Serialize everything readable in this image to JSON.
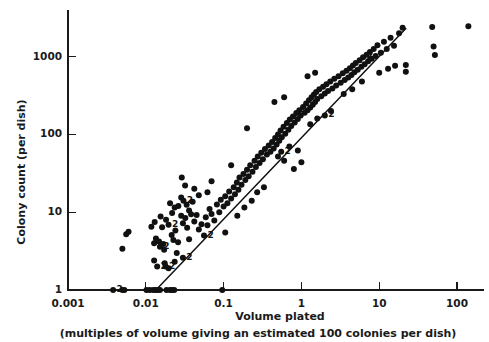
{
  "chart_data": {
    "type": "scatter",
    "title": "",
    "xlabel": "Volume plated",
    "xsublabel": "(multiples of volume giving an estimated 100 colonies per dish)",
    "ylabel": "Colony count (per dish)",
    "xscale": "log",
    "yscale": "log",
    "xlim": [
      0.001,
      200
    ],
    "ylim": [
      0.9,
      3000
    ],
    "grid": false,
    "legend": null,
    "xticks": [
      0.001,
      0.01,
      0.1,
      1,
      10,
      100
    ],
    "xtick_labels": [
      "0.001",
      "0.01",
      "0.1",
      "1",
      "10",
      "100"
    ],
    "yticks": [
      1,
      10,
      100,
      1000
    ],
    "ytick_labels": [
      "1",
      "10",
      "100",
      "1000"
    ],
    "fit_line": {
      "description": "reference line of slope 1 through 100 colonies at volume 1",
      "x_start": 0.0135,
      "y_start": 1.0,
      "x_end": 22.0,
      "y_end": 2300.0
    },
    "point_marker": "filled-circle",
    "point_radius_px": 3.0,
    "multiplicity_annotation": "2",
    "points": [
      {
        "x": 0.0038,
        "y": 1,
        "n": 2
      },
      {
        "x": 0.005,
        "y": 1,
        "n": 1
      },
      {
        "x": 0.0053,
        "y": 1,
        "n": 1
      },
      {
        "x": 0.0102,
        "y": 1,
        "n": 1
      },
      {
        "x": 0.0112,
        "y": 1,
        "n": 1
      },
      {
        "x": 0.0124,
        "y": 1,
        "n": 1
      },
      {
        "x": 0.0133,
        "y": 1,
        "n": 1
      },
      {
        "x": 0.0142,
        "y": 1,
        "n": 1
      },
      {
        "x": 0.0152,
        "y": 1,
        "n": 1
      },
      {
        "x": 0.0185,
        "y": 1,
        "n": 1
      },
      {
        "x": 0.0205,
        "y": 1,
        "n": 1
      },
      {
        "x": 0.0218,
        "y": 1,
        "n": 1
      },
      {
        "x": 0.0232,
        "y": 1,
        "n": 1
      },
      {
        "x": 0.096,
        "y": 1,
        "n": 1
      },
      {
        "x": 0.005,
        "y": 3.4,
        "n": 1
      },
      {
        "x": 0.0056,
        "y": 5.2,
        "n": 1
      },
      {
        "x": 0.006,
        "y": 5.6,
        "n": 1
      },
      {
        "x": 0.0128,
        "y": 2.4,
        "n": 1
      },
      {
        "x": 0.014,
        "y": 2.0,
        "n": 2
      },
      {
        "x": 0.0175,
        "y": 2.2,
        "n": 1
      },
      {
        "x": 0.018,
        "y": 2.0,
        "n": 2
      },
      {
        "x": 0.0196,
        "y": 1.9,
        "n": 1
      },
      {
        "x": 0.0235,
        "y": 2.3,
        "n": 1
      },
      {
        "x": 0.0128,
        "y": 4.0,
        "n": 1
      },
      {
        "x": 0.0135,
        "y": 4.6,
        "n": 1
      },
      {
        "x": 0.0148,
        "y": 4.2,
        "n": 1
      },
      {
        "x": 0.0152,
        "y": 3.6,
        "n": 2
      },
      {
        "x": 0.0168,
        "y": 3.9,
        "n": 1
      },
      {
        "x": 0.0172,
        "y": 3.3,
        "n": 1
      },
      {
        "x": 0.0118,
        "y": 6.5,
        "n": 1
      },
      {
        "x": 0.013,
        "y": 7.5,
        "n": 1
      },
      {
        "x": 0.0155,
        "y": 8.8,
        "n": 1
      },
      {
        "x": 0.0162,
        "y": 6.4,
        "n": 1
      },
      {
        "x": 0.0182,
        "y": 8.0,
        "n": 1
      },
      {
        "x": 0.0196,
        "y": 6.9,
        "n": 2
      },
      {
        "x": 0.0215,
        "y": 5.1,
        "n": 1
      },
      {
        "x": 0.0226,
        "y": 4.4,
        "n": 1
      },
      {
        "x": 0.024,
        "y": 5.8,
        "n": 1
      },
      {
        "x": 0.026,
        "y": 4.1,
        "n": 1
      },
      {
        "x": 0.0205,
        "y": 13.0,
        "n": 1
      },
      {
        "x": 0.0218,
        "y": 9.8,
        "n": 1
      },
      {
        "x": 0.0235,
        "y": 11.5,
        "n": 1
      },
      {
        "x": 0.0262,
        "y": 12.0,
        "n": 1
      },
      {
        "x": 0.0285,
        "y": 9.0,
        "n": 1
      },
      {
        "x": 0.03,
        "y": 7.2,
        "n": 1
      },
      {
        "x": 0.0322,
        "y": 8.4,
        "n": 1
      },
      {
        "x": 0.034,
        "y": 6.3,
        "n": 1
      },
      {
        "x": 0.0285,
        "y": 15.5,
        "n": 1
      },
      {
        "x": 0.0305,
        "y": 14.0,
        "n": 2
      },
      {
        "x": 0.0335,
        "y": 12.5,
        "n": 1
      },
      {
        "x": 0.036,
        "y": 10.5,
        "n": 1
      },
      {
        "x": 0.0382,
        "y": 9.4,
        "n": 1
      },
      {
        "x": 0.04,
        "y": 13.6,
        "n": 1
      },
      {
        "x": 0.042,
        "y": 7.6,
        "n": 1
      },
      {
        "x": 0.045,
        "y": 9.2,
        "n": 1
      },
      {
        "x": 0.048,
        "y": 6.0,
        "n": 1
      },
      {
        "x": 0.052,
        "y": 7.0,
        "n": 1
      },
      {
        "x": 0.056,
        "y": 5.0,
        "n": 2
      },
      {
        "x": 0.059,
        "y": 8.6,
        "n": 1
      },
      {
        "x": 0.062,
        "y": 6.8,
        "n": 1
      },
      {
        "x": 0.066,
        "y": 11.0,
        "n": 1
      },
      {
        "x": 0.07,
        "y": 9.5,
        "n": 1
      },
      {
        "x": 0.076,
        "y": 7.8,
        "n": 1
      },
      {
        "x": 0.082,
        "y": 12.6,
        "n": 1
      },
      {
        "x": 0.088,
        "y": 10.0,
        "n": 1
      },
      {
        "x": 0.092,
        "y": 14.5,
        "n": 1
      },
      {
        "x": 0.1,
        "y": 11.8,
        "n": 1
      },
      {
        "x": 0.105,
        "y": 16.0,
        "n": 1
      },
      {
        "x": 0.112,
        "y": 13.0,
        "n": 1
      },
      {
        "x": 0.118,
        "y": 18.5,
        "n": 1
      },
      {
        "x": 0.125,
        "y": 15.0,
        "n": 1
      },
      {
        "x": 0.135,
        "y": 21.0,
        "n": 1
      },
      {
        "x": 0.14,
        "y": 17.0,
        "n": 1
      },
      {
        "x": 0.148,
        "y": 24.0,
        "n": 1
      },
      {
        "x": 0.155,
        "y": 19.5,
        "n": 1
      },
      {
        "x": 0.16,
        "y": 28.0,
        "n": 1
      },
      {
        "x": 0.17,
        "y": 22.5,
        "n": 1
      },
      {
        "x": 0.18,
        "y": 31.0,
        "n": 1
      },
      {
        "x": 0.19,
        "y": 26.0,
        "n": 1
      },
      {
        "x": 0.2,
        "y": 35.0,
        "n": 1
      },
      {
        "x": 0.21,
        "y": 29.0,
        "n": 1
      },
      {
        "x": 0.22,
        "y": 40.0,
        "n": 1
      },
      {
        "x": 0.235,
        "y": 33.0,
        "n": 1
      },
      {
        "x": 0.25,
        "y": 46.0,
        "n": 1
      },
      {
        "x": 0.26,
        "y": 38.0,
        "n": 1
      },
      {
        "x": 0.275,
        "y": 52.0,
        "n": 1
      },
      {
        "x": 0.29,
        "y": 43.0,
        "n": 1
      },
      {
        "x": 0.305,
        "y": 58.0,
        "n": 1
      },
      {
        "x": 0.32,
        "y": 48.0,
        "n": 1
      },
      {
        "x": 0.34,
        "y": 65.0,
        "n": 1
      },
      {
        "x": 0.36,
        "y": 55.0,
        "n": 1
      },
      {
        "x": 0.125,
        "y": 40.0,
        "n": 1
      },
      {
        "x": 0.15,
        "y": 9.0,
        "n": 1
      },
      {
        "x": 0.185,
        "y": 11.5,
        "n": 1
      },
      {
        "x": 0.23,
        "y": 14.0,
        "n": 1
      },
      {
        "x": 0.2,
        "y": 120.0,
        "n": 1
      },
      {
        "x": 0.38,
        "y": 72.0,
        "n": 1
      },
      {
        "x": 0.4,
        "y": 60.0,
        "n": 1
      },
      {
        "x": 0.42,
        "y": 80.0,
        "n": 1
      },
      {
        "x": 0.44,
        "y": 66.0,
        "n": 1
      },
      {
        "x": 0.46,
        "y": 90.0,
        "n": 1
      },
      {
        "x": 0.48,
        "y": 74.0,
        "n": 1
      },
      {
        "x": 0.5,
        "y": 100.0,
        "n": 1
      },
      {
        "x": 0.52,
        "y": 83.0,
        "n": 1
      },
      {
        "x": 0.54,
        "y": 112.0,
        "n": 1
      },
      {
        "x": 0.56,
        "y": 92.0,
        "n": 1
      },
      {
        "x": 0.59,
        "y": 125.0,
        "n": 1
      },
      {
        "x": 0.62,
        "y": 102.0,
        "n": 1
      },
      {
        "x": 0.65,
        "y": 140.0,
        "n": 1
      },
      {
        "x": 0.68,
        "y": 115.0,
        "n": 1
      },
      {
        "x": 0.71,
        "y": 155.0,
        "n": 1
      },
      {
        "x": 0.74,
        "y": 128.0,
        "n": 1
      },
      {
        "x": 0.78,
        "y": 170.0,
        "n": 1
      },
      {
        "x": 0.82,
        "y": 142.0,
        "n": 1
      },
      {
        "x": 0.86,
        "y": 188.0,
        "n": 1
      },
      {
        "x": 0.9,
        "y": 158.0,
        "n": 1
      },
      {
        "x": 0.94,
        "y": 205.0,
        "n": 1
      },
      {
        "x": 0.98,
        "y": 175.0,
        "n": 1
      },
      {
        "x": 0.5,
        "y": 52.0,
        "n": 1
      },
      {
        "x": 0.55,
        "y": 60.0,
        "n": 2
      },
      {
        "x": 0.6,
        "y": 46.0,
        "n": 1
      },
      {
        "x": 0.7,
        "y": 70.0,
        "n": 1
      },
      {
        "x": 0.45,
        "y": 260.0,
        "n": 1
      },
      {
        "x": 0.6,
        "y": 300.0,
        "n": 1
      },
      {
        "x": 0.9,
        "y": 62.0,
        "n": 1
      },
      {
        "x": 1.05,
        "y": 225.0,
        "n": 1
      },
      {
        "x": 1.1,
        "y": 190.0,
        "n": 1
      },
      {
        "x": 1.15,
        "y": 250.0,
        "n": 1
      },
      {
        "x": 1.2,
        "y": 205.0,
        "n": 1
      },
      {
        "x": 1.25,
        "y": 275.0,
        "n": 1
      },
      {
        "x": 1.3,
        "y": 222.0,
        "n": 1
      },
      {
        "x": 1.35,
        "y": 300.0,
        "n": 1
      },
      {
        "x": 1.4,
        "y": 240.0,
        "n": 1
      },
      {
        "x": 1.45,
        "y": 325.0,
        "n": 1
      },
      {
        "x": 1.5,
        "y": 260.0,
        "n": 1
      },
      {
        "x": 1.55,
        "y": 350.0,
        "n": 1
      },
      {
        "x": 1.6,
        "y": 285.0,
        "n": 1
      },
      {
        "x": 1.7,
        "y": 380.0,
        "n": 1
      },
      {
        "x": 1.8,
        "y": 310.0,
        "n": 1
      },
      {
        "x": 1.9,
        "y": 410.0,
        "n": 1
      },
      {
        "x": 2.0,
        "y": 335.0,
        "n": 1
      },
      {
        "x": 2.1,
        "y": 440.0,
        "n": 1
      },
      {
        "x": 2.2,
        "y": 360.0,
        "n": 1
      },
      {
        "x": 2.35,
        "y": 480.0,
        "n": 1
      },
      {
        "x": 2.5,
        "y": 390.0,
        "n": 1
      },
      {
        "x": 2.65,
        "y": 520.0,
        "n": 1
      },
      {
        "x": 2.8,
        "y": 425.0,
        "n": 1
      },
      {
        "x": 1.3,
        "y": 135.0,
        "n": 1
      },
      {
        "x": 1.6,
        "y": 160.0,
        "n": 1
      },
      {
        "x": 2.0,
        "y": 175.0,
        "n": 2
      },
      {
        "x": 2.4,
        "y": 200.0,
        "n": 1
      },
      {
        "x": 1.2,
        "y": 560.0,
        "n": 1
      },
      {
        "x": 1.5,
        "y": 620.0,
        "n": 1
      },
      {
        "x": 3.0,
        "y": 560.0,
        "n": 1
      },
      {
        "x": 3.2,
        "y": 460.0,
        "n": 1
      },
      {
        "x": 3.4,
        "y": 610.0,
        "n": 1
      },
      {
        "x": 3.6,
        "y": 500.0,
        "n": 1
      },
      {
        "x": 3.8,
        "y": 660.0,
        "n": 1
      },
      {
        "x": 4.0,
        "y": 540.0,
        "n": 1
      },
      {
        "x": 4.2,
        "y": 710.0,
        "n": 1
      },
      {
        "x": 4.4,
        "y": 580.0,
        "n": 1
      },
      {
        "x": 4.6,
        "y": 770.0,
        "n": 1
      },
      {
        "x": 4.8,
        "y": 630.0,
        "n": 1
      },
      {
        "x": 5.0,
        "y": 830.0,
        "n": 1
      },
      {
        "x": 5.3,
        "y": 680.0,
        "n": 1
      },
      {
        "x": 5.6,
        "y": 900.0,
        "n": 1
      },
      {
        "x": 5.9,
        "y": 740.0,
        "n": 1
      },
      {
        "x": 6.2,
        "y": 980.0,
        "n": 2
      },
      {
        "x": 6.5,
        "y": 800.0,
        "n": 1
      },
      {
        "x": 6.9,
        "y": 1060.0,
        "n": 1
      },
      {
        "x": 7.2,
        "y": 870.0,
        "n": 1
      },
      {
        "x": 7.6,
        "y": 1150.0,
        "n": 1
      },
      {
        "x": 8.0,
        "y": 940.0,
        "n": 1
      },
      {
        "x": 3.5,
        "y": 330.0,
        "n": 1
      },
      {
        "x": 4.5,
        "y": 380.0,
        "n": 1
      },
      {
        "x": 6.0,
        "y": 480.0,
        "n": 1
      },
      {
        "x": 8.5,
        "y": 1250.0,
        "n": 1
      },
      {
        "x": 9.0,
        "y": 1020.0,
        "n": 1
      },
      {
        "x": 9.5,
        "y": 1400.0,
        "n": 1
      },
      {
        "x": 10.5,
        "y": 1120.0,
        "n": 1
      },
      {
        "x": 11.5,
        "y": 1550.0,
        "n": 1
      },
      {
        "x": 12.5,
        "y": 1250.0,
        "n": 1
      },
      {
        "x": 14.0,
        "y": 1750.0,
        "n": 1
      },
      {
        "x": 15.5,
        "y": 1380.0,
        "n": 1
      },
      {
        "x": 18.0,
        "y": 2000.0,
        "n": 1
      },
      {
        "x": 20.0,
        "y": 2350.0,
        "n": 1
      },
      {
        "x": 10.0,
        "y": 620.0,
        "n": 1
      },
      {
        "x": 13.0,
        "y": 700.0,
        "n": 1
      },
      {
        "x": 16.0,
        "y": 760.0,
        "n": 1
      },
      {
        "x": 22.0,
        "y": 780.0,
        "n": 1
      },
      {
        "x": 22.0,
        "y": 640.0,
        "n": 1
      },
      {
        "x": 48.0,
        "y": 2400.0,
        "n": 1
      },
      {
        "x": 50.0,
        "y": 1350.0,
        "n": 1
      },
      {
        "x": 52.0,
        "y": 1050.0,
        "n": 1
      },
      {
        "x": 140.0,
        "y": 2450.0,
        "n": 1
      },
      {
        "x": 0.029,
        "y": 28.0,
        "n": 1
      },
      {
        "x": 0.032,
        "y": 22.0,
        "n": 1
      },
      {
        "x": 0.062,
        "y": 18.0,
        "n": 1
      },
      {
        "x": 0.07,
        "y": 25.0,
        "n": 1
      },
      {
        "x": 0.048,
        "y": 16.5,
        "n": 1
      },
      {
        "x": 0.042,
        "y": 20.0,
        "n": 1
      },
      {
        "x": 0.105,
        "y": 5.5,
        "n": 1
      },
      {
        "x": 0.036,
        "y": 4.5,
        "n": 1
      },
      {
        "x": 0.025,
        "y": 3.0,
        "n": 1
      },
      {
        "x": 0.03,
        "y": 2.6,
        "n": 2
      },
      {
        "x": 0.27,
        "y": 18.0,
        "n": 1
      },
      {
        "x": 0.33,
        "y": 21.0,
        "n": 1
      },
      {
        "x": 0.8,
        "y": 36.0,
        "n": 1
      },
      {
        "x": 1.0,
        "y": 44.0,
        "n": 1
      }
    ]
  },
  "axes": {
    "x_tick_values": [
      "0.001",
      "0.01",
      "0.1",
      "1",
      "10",
      "100"
    ],
    "y_tick_values": [
      "1",
      "10",
      "100",
      "1000"
    ]
  }
}
